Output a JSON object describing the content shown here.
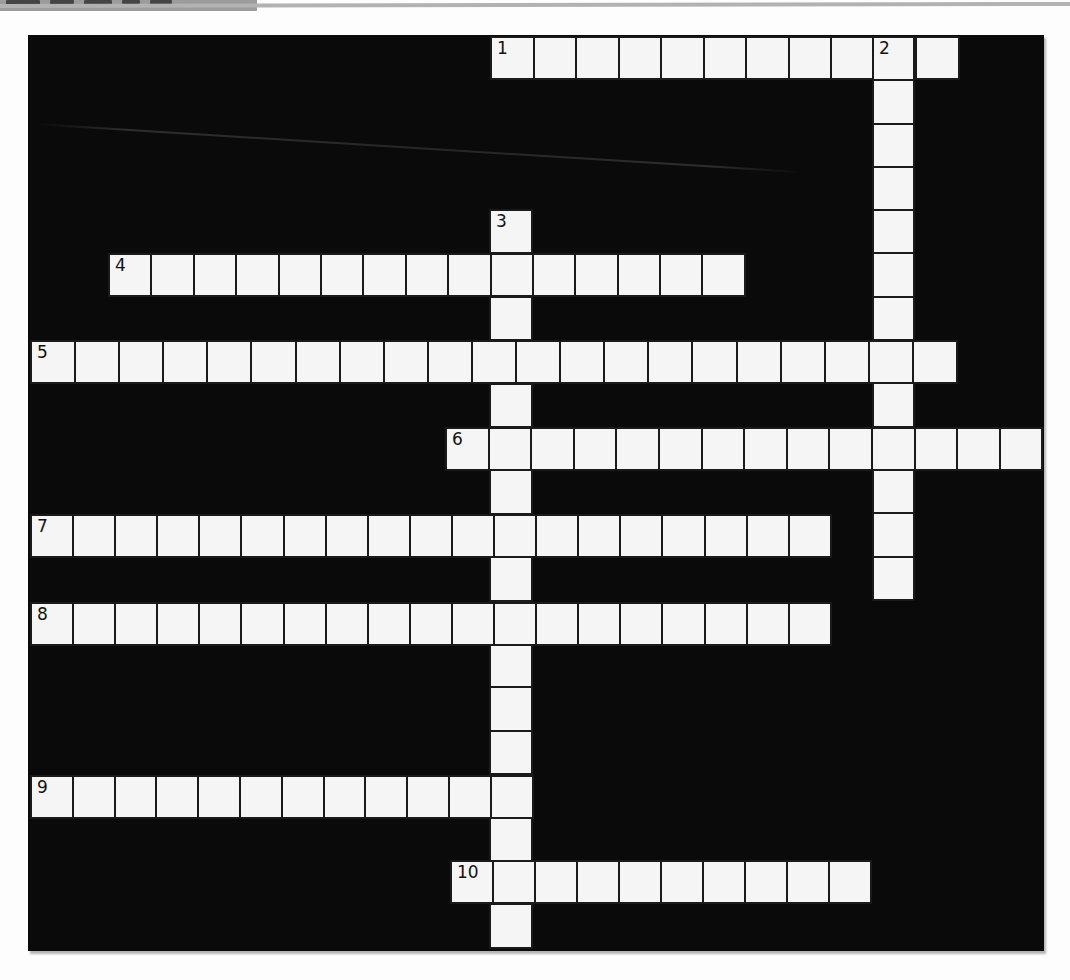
{
  "page": {
    "background": "#fdfdfd",
    "edge_tab_color": "#9c9c9c",
    "top_rule_color": "#b2b2b2"
  },
  "puzzle": {
    "board": {
      "x": 28,
      "y": 35,
      "width": 1016,
      "height": 916,
      "color": "#0a0a0a"
    },
    "cell_style": {
      "fill": "#f5f5f5",
      "border_color": "#1a1a1a",
      "number_color": "#121212"
    },
    "entries": [
      {
        "number": "1",
        "direction": "across",
        "cells": 11,
        "x": 490,
        "y": 36,
        "pitch": 42.5,
        "thickness": 44
      },
      {
        "number": "2",
        "direction": "down",
        "cells": 13,
        "x": 872,
        "y": 36,
        "pitch": 43.3,
        "thickness": 43
      },
      {
        "number": "3",
        "direction": "down",
        "cells": 17,
        "x": 489,
        "y": 209,
        "pitch": 43.4,
        "thickness": 44
      },
      {
        "number": "4",
        "direction": "across",
        "cells": 15,
        "x": 108,
        "y": 253,
        "pitch": 42.4,
        "thickness": 44
      },
      {
        "number": "5",
        "direction": "across",
        "cells": 21,
        "x": 30,
        "y": 340,
        "pitch": 44.1,
        "thickness": 44
      },
      {
        "number": "6",
        "direction": "across",
        "cells": 14,
        "x": 445,
        "y": 427,
        "pitch": 42.6,
        "thickness": 44
      },
      {
        "number": "7",
        "direction": "across",
        "cells": 19,
        "x": 30,
        "y": 514,
        "pitch": 42.1,
        "thickness": 44
      },
      {
        "number": "8",
        "direction": "across",
        "cells": 19,
        "x": 30,
        "y": 602,
        "pitch": 42.1,
        "thickness": 44
      },
      {
        "number": "9",
        "direction": "across",
        "cells": 12,
        "x": 30,
        "y": 775,
        "pitch": 41.8,
        "thickness": 44
      },
      {
        "number": "10",
        "direction": "across",
        "cells": 10,
        "x": 450,
        "y": 860,
        "pitch": 42.0,
        "thickness": 44
      }
    ]
  },
  "artifacts": {
    "tab_marks": [
      {
        "x": 6,
        "w": 34,
        "h": 5
      },
      {
        "x": 50,
        "w": 24,
        "h": 4
      },
      {
        "x": 84,
        "w": 28,
        "h": 5
      },
      {
        "x": 122,
        "w": 18,
        "h": 4
      },
      {
        "x": 150,
        "w": 22,
        "h": 4
      }
    ],
    "scratch": {
      "x": 35,
      "y": 123,
      "length": 770,
      "angle_deg": 3.6
    }
  }
}
